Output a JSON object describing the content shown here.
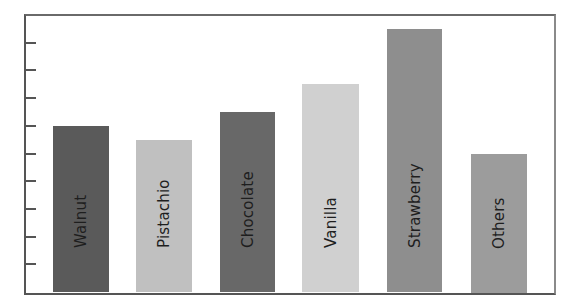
{
  "chart_data": {
    "type": "bar",
    "title": "",
    "xlabel": "",
    "ylabel": "",
    "categories": [
      "Walnut",
      "Pistachio",
      "Chocolate",
      "Vanilla",
      "Strawberry",
      "Others"
    ],
    "values": [
      6,
      5.5,
      6.5,
      7.5,
      9.5,
      5
    ],
    "colors": [
      "#5a5a5a",
      "#c0c0c0",
      "#686868",
      "#d0d0d0",
      "#8e8e8e",
      "#9c9c9c"
    ],
    "ylim": [
      0,
      10
    ],
    "y_tick_count": 9,
    "y_tick_labels_shown": false,
    "grid": false,
    "legend": "none",
    "bar_labels": "inside, rotated vertical"
  },
  "layout": {
    "plot": {
      "left": 25,
      "top": 15,
      "right": 552,
      "bottom": 292
    },
    "bars": [
      {
        "x": 53,
        "width": 56
      },
      {
        "x": 136,
        "width": 56
      },
      {
        "x": 220,
        "width": 55
      },
      {
        "x": 302,
        "width": 57
      },
      {
        "x": 387,
        "width": 55
      },
      {
        "x": 471,
        "width": 56
      }
    ]
  }
}
